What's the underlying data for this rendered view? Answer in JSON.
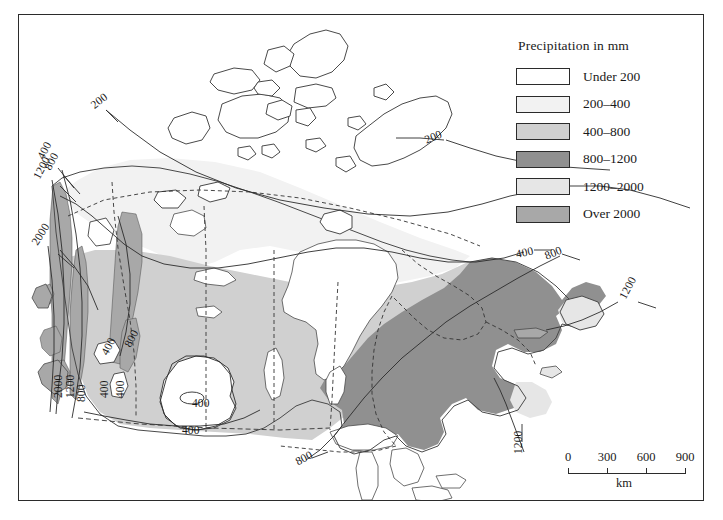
{
  "map": {
    "title": "Precipitation in mm",
    "region": "Canada",
    "frame": true
  },
  "legend": {
    "title": "Precipitation in mm",
    "items": [
      {
        "label": "Under 200",
        "color": "#ffffff"
      },
      {
        "label": "200–400",
        "color": "#f2f2f2"
      },
      {
        "label": "400–800",
        "color": "#d0d0d0"
      },
      {
        "label": "800–1200",
        "color": "#909090"
      },
      {
        "label": "1200–2000",
        "color": "#e6e6e6"
      },
      {
        "label": "Over 2000",
        "color": "#a8a8a8"
      }
    ]
  },
  "scale": {
    "unit": "km",
    "ticks": [
      "0",
      "300",
      "600",
      "900"
    ]
  },
  "contour_labels": [
    {
      "text": "200",
      "x": 92,
      "y": 100,
      "rot": -38
    },
    {
      "text": "400",
      "x": 40,
      "y": 152,
      "rot": -62
    },
    {
      "text": "800",
      "x": 47,
      "y": 163,
      "rot": -62
    },
    {
      "text": "1200",
      "x": 36,
      "y": 172,
      "rot": -62
    },
    {
      "text": "2000",
      "x": 34,
      "y": 238,
      "rot": -58
    },
    {
      "text": "200",
      "x": 425,
      "y": 134,
      "rot": -22
    },
    {
      "text": "400",
      "x": 516,
      "y": 248,
      "rot": -12
    },
    {
      "text": "800",
      "x": 545,
      "y": 250,
      "rot": -22
    },
    {
      "text": "1200",
      "x": 622,
      "y": 292,
      "rot": -62
    },
    {
      "text": "400",
      "x": 104,
      "y": 348,
      "rot": -62
    },
    {
      "text": "800",
      "x": 127,
      "y": 340,
      "rot": -62
    },
    {
      "text": "2000",
      "x": 58,
      "y": 392,
      "rot": -90
    },
    {
      "text": "1200",
      "x": 70,
      "y": 392,
      "rot": -90
    },
    {
      "text": "800",
      "x": 81,
      "y": 396,
      "rot": -90
    },
    {
      "text": "400",
      "x": 104,
      "y": 392,
      "rot": -90
    },
    {
      "text": "400",
      "x": 120,
      "y": 392,
      "rot": -90
    },
    {
      "text": "400",
      "x": 192,
      "y": 397,
      "rot": 0
    },
    {
      "text": "400",
      "x": 182,
      "y": 424,
      "rot": 0
    },
    {
      "text": "800",
      "x": 296,
      "y": 456,
      "rot": -28
    },
    {
      "text": "1200",
      "x": 518,
      "y": 448,
      "rot": -90
    }
  ],
  "colors": {
    "outline": "#4a4a4a",
    "contour": "#2b2b2b",
    "border_dashed": "#333333",
    "frame": "#2b2b2b",
    "under_200": "#ffffff",
    "c200_400": "#f2f2f2",
    "c400_800": "#d0d0d0",
    "c800_1200": "#909090",
    "c1200_2000": "#e6e6e6",
    "over_2000": "#a8a8a8"
  }
}
